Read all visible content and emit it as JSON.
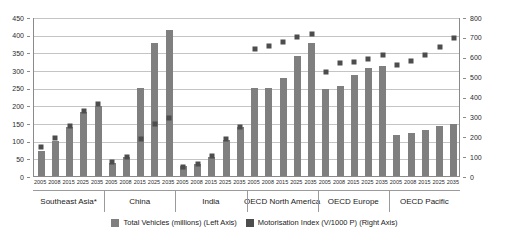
{
  "chart_data": {
    "type": "bar",
    "title": "",
    "subtitle": "",
    "xlabel": "",
    "ylabel": "",
    "y_left": {
      "label": "Total Vehicles (millions) (Left Axis)",
      "ticks": [
        0,
        50,
        100,
        150,
        200,
        250,
        300,
        350,
        400,
        450
      ],
      "ylim": [
        0,
        450
      ]
    },
    "y_right": {
      "label": "Motorisation Index (V/1000 P) (Right Axis)",
      "ticks": [
        0,
        100,
        200,
        300,
        400,
        500,
        600,
        700,
        800
      ],
      "ylim": [
        0,
        800
      ]
    },
    "grid": true,
    "legend_position": "bottom",
    "legend": [
      {
        "name": "Total Vehicles (millions) (Left Axis)",
        "color": "#7f7f7f",
        "shape": "bar"
      },
      {
        "name": "Motorisation Index (V/1000 P) (Right Axis)",
        "color": "#4d4d4d",
        "shape": "square"
      }
    ],
    "years": [
      "2005",
      "2008",
      "2015",
      "2025",
      "2035"
    ],
    "groups": [
      {
        "name": "Southeast Asia*",
        "categories": [
          "2005",
          "2008",
          "2015",
          "2025",
          "2035"
        ],
        "total_vehicles": [
          72,
          98,
          140,
          182,
          197
        ],
        "motorisation_index": [
          148,
          193,
          252,
          328,
          362
        ]
      },
      {
        "name": "China",
        "categories": [
          "2005",
          "2008",
          "2015",
          "2025",
          "2035"
        ],
        "total_vehicles": [
          37,
          55,
          248,
          377,
          414
        ],
        "motorisation_index": [
          72,
          96,
          185,
          264,
          294
        ]
      },
      {
        "name": "India",
        "categories": [
          "2005",
          "2008",
          "2015",
          "2025",
          "2035"
        ],
        "total_vehicles": [
          28,
          34,
          55,
          103,
          139
        ],
        "motorisation_index": [
          44,
          60,
          99,
          185,
          249
        ]
      },
      {
        "name": "OECD North America",
        "categories": [
          "2005",
          "2008",
          "2015",
          "2025",
          "2035"
        ],
        "total_vehicles": [
          248,
          250,
          278,
          340,
          377
        ],
        "motorisation_index": [
          640,
          652,
          672,
          700,
          716
        ]
      },
      {
        "name": "OECD Europe",
        "categories": [
          "2005",
          "2008",
          "2015",
          "2025",
          "2035"
        ],
        "total_vehicles": [
          245,
          254,
          286,
          305,
          310
        ],
        "motorisation_index": [
          524,
          568,
          574,
          590,
          608
        ]
      },
      {
        "name": "OECD Pacific",
        "categories": [
          "2005",
          "2008",
          "2015",
          "2025",
          "2035"
        ],
        "total_vehicles": [
          117,
          122,
          131,
          141,
          148
        ],
        "motorisation_index": [
          560,
          578,
          608,
          648,
          692
        ]
      }
    ]
  },
  "colors": {
    "bar": "#7f7f7f",
    "marker": "#4d4d4d",
    "grid": "#c4c4c4",
    "axis": "#8a8a8a",
    "text": "#1a1a1a"
  }
}
